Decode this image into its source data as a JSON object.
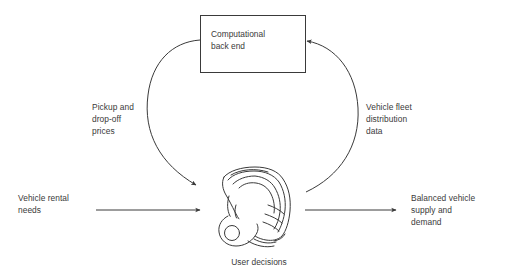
{
  "diagram": {
    "type": "cycle-flow-diagram",
    "background_color": "#ffffff",
    "stroke_color": "#3a3a3a",
    "text_color": "#3a3a3a",
    "box": {
      "label": "Computational\nback end"
    },
    "center_illustration": {
      "icon_name": "three-wheeled-scooter-illustration",
      "caption": "User decisions"
    },
    "flows": {
      "left_arc_label": "Pickup and\ndrop-off\nprices",
      "right_arc_label": "Vehicle fleet\ndistribution\ndata",
      "input_label": "Vehicle rental\nneeds",
      "output_label": "Balanced vehicle\nsupply and\ndemand"
    }
  }
}
